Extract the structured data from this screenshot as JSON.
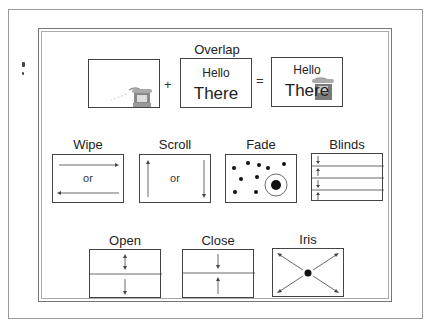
{
  "overlap": {
    "title": "Overlap",
    "plus": "+",
    "equals": "=",
    "box2_line1": "Hello",
    "box2_line2": "There",
    "box3_line1": "Hello",
    "box3_line2": "There",
    "icon": "telephone-icon"
  },
  "transitions_row1": [
    {
      "label": "Wipe",
      "middle": "or"
    },
    {
      "label": "Scroll",
      "middle": "or"
    },
    {
      "label": "Fade"
    },
    {
      "label": "Blinds",
      "arrows": [
        "down",
        "up",
        "down",
        "up"
      ]
    }
  ],
  "transitions_row2": [
    {
      "label": "Open"
    },
    {
      "label": "Close"
    },
    {
      "label": "Iris"
    }
  ],
  "colors": {
    "line": "#444444",
    "frame": "#9a9a9a",
    "phone": "#7a7a7a"
  }
}
